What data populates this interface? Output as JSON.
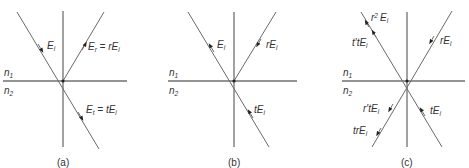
{
  "figure": {
    "panels": [
      {
        "id": "a",
        "caption": "(a)",
        "medium_top": {
          "n": "n",
          "sub": "1"
        },
        "medium_bottom": {
          "n": "n",
          "sub": "2"
        },
        "rays": [
          {
            "name": "incident",
            "label": "E",
            "label_sub": "i",
            "direction": "in"
          },
          {
            "name": "reflected",
            "label": "E",
            "label_sub": "r",
            "eq": " = rE",
            "eq_sub": "i",
            "direction": "out"
          },
          {
            "name": "transmitted",
            "label": "E",
            "label_sub": "t",
            "eq": " = tE",
            "eq_sub": "i",
            "direction": "out"
          }
        ]
      },
      {
        "id": "b",
        "caption": "(b)",
        "medium_top": {
          "n": "n",
          "sub": "1"
        },
        "medium_bottom": {
          "n": "n",
          "sub": "2"
        },
        "rays": [
          {
            "name": "incident-reversed",
            "label": "E",
            "label_sub": "i",
            "direction": "out"
          },
          {
            "name": "reflected-reversed",
            "label": "rE",
            "label_sub": "i",
            "direction": "in"
          },
          {
            "name": "transmitted-reversed",
            "label": "tE",
            "label_sub": "i",
            "direction": "in"
          }
        ]
      },
      {
        "id": "c",
        "caption": "(c)",
        "medium_top": {
          "n": "n",
          "sub": "1"
        },
        "medium_bottom": {
          "n": "n",
          "sub": "2"
        },
        "rays": [
          {
            "name": "r-squared",
            "label": "r",
            "sup": "2",
            "label2": "E",
            "label_sub": "i",
            "direction": "out"
          },
          {
            "name": "t-prime-t",
            "label": "t′tE",
            "label_sub": "i",
            "direction": "out"
          },
          {
            "name": "r-incoming",
            "label": "rE",
            "label_sub": "i",
            "direction": "in"
          },
          {
            "name": "t-incoming",
            "label": "tE",
            "label_sub": "i",
            "direction": "in"
          },
          {
            "name": "r-prime-t",
            "label": "r′tE",
            "label_sub": "i",
            "direction": "out"
          },
          {
            "name": "tr",
            "label": "trE",
            "label_sub": "i",
            "direction": "out"
          }
        ]
      }
    ]
  }
}
